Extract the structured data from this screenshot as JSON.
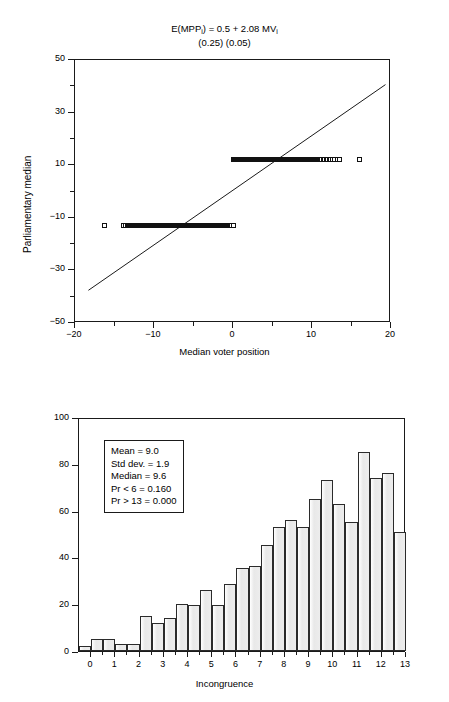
{
  "figure": {
    "panels": [
      "scatter",
      "histogram"
    ]
  },
  "scatter": {
    "title_line1_parts": {
      "lhs": "E(MPP",
      "lhs_sub": "i",
      "rhs": ") = 0.5 + 2.08 MV",
      "rhs_sub": "i"
    },
    "title_line1": "E(MPPi) = 0.5 + 2.08 MVi",
    "title_line2": "(0.25) (0.05)",
    "xlabel": "Median voter position",
    "ylabel": "Parliamentary median",
    "xticks": [
      "-20",
      "-10",
      "0",
      "10",
      "20"
    ],
    "yticks": [
      "50",
      "30",
      "10",
      "-10",
      "-30",
      "-50"
    ],
    "xlim": [
      -20,
      20
    ],
    "ylim": [
      -50,
      50
    ]
  },
  "histogram": {
    "xlabel": "Incongruence",
    "xticks": [
      "0.0",
      "1",
      "2",
      "3",
      "4",
      "5",
      "6",
      "7",
      "8",
      "9",
      "10",
      "11",
      "12",
      "13"
    ],
    "yticks": [
      "100",
      "80",
      "60",
      "40",
      "20",
      "0"
    ],
    "stats": {
      "mean": "Mean = 9.0",
      "std_dev": "Std dev. = 1.9",
      "median": "Median = 9.6",
      "pr_lt_6": "Pr < 6 = 0.160",
      "pr_gt_13": "Pr > 13 = 0.000"
    }
  },
  "chart_data": [
    {
      "type": "scatter",
      "title": "E(MPPi) = 0.5 + 2.08 MVi   (0.25) (0.05)",
      "xlabel": "Median voter position",
      "ylabel": "Parliamentary median",
      "xlim": [
        -20,
        20
      ],
      "ylim": [
        -50,
        50
      ],
      "xticks": [
        -20,
        -10,
        0,
        10,
        20
      ],
      "yticks": [
        50,
        30,
        10,
        -10,
        -30,
        -50
      ],
      "grid": false,
      "legend": null,
      "fit_line": {
        "intercept": 0.5,
        "slope": 2.08,
        "se_intercept": 0.25,
        "se_slope": 0.05,
        "x_from": -18.3,
        "x_to": 19.3
      },
      "series": [
        {
          "name": "upper band (parliamentary median = 12)",
          "y_value": 12,
          "marker": "square",
          "x": [
            0.0,
            0.15,
            0.3,
            0.45,
            0.6,
            0.75,
            0.9,
            1.05,
            1.2,
            1.35,
            1.5,
            1.65,
            1.8,
            1.95,
            2.1,
            2.25,
            2.4,
            2.55,
            2.7,
            2.85,
            3.0,
            3.15,
            3.3,
            3.45,
            3.6,
            3.75,
            3.9,
            4.05,
            4.2,
            4.35,
            4.5,
            4.65,
            4.8,
            4.95,
            5.1,
            5.25,
            5.4,
            5.55,
            5.7,
            5.85,
            6.0,
            6.15,
            6.3,
            6.45,
            6.6,
            6.75,
            6.9,
            7.05,
            7.2,
            7.35,
            7.5,
            7.65,
            7.8,
            7.95,
            8.1,
            8.25,
            8.4,
            8.55,
            8.7,
            8.85,
            9.0,
            9.15,
            9.3,
            9.45,
            9.6,
            9.75,
            9.9,
            10.05,
            10.2,
            10.35,
            10.5,
            10.65,
            10.8,
            11.0,
            11.2,
            11.4,
            11.6,
            11.8,
            12.0,
            12.2,
            12.4,
            12.6,
            12.9,
            13.2,
            13.5,
            16.0
          ]
        },
        {
          "name": "lower band (parliamentary median = -13)",
          "y_value": -13,
          "marker": "square",
          "x": [
            -16.3,
            -13.9,
            -13.6,
            -13.3,
            -13.1,
            -12.9,
            -12.7,
            -12.5,
            -12.3,
            -12.1,
            -11.9,
            -11.7,
            -11.5,
            -11.3,
            -11.1,
            -10.9,
            -10.7,
            -10.5,
            -10.3,
            -10.1,
            -9.9,
            -9.7,
            -9.5,
            -9.3,
            -9.1,
            -8.9,
            -8.7,
            -8.5,
            -8.3,
            -8.1,
            -7.9,
            -7.7,
            -7.5,
            -7.3,
            -7.1,
            -6.9,
            -6.7,
            -6.5,
            -6.3,
            -6.1,
            -5.9,
            -5.7,
            -5.5,
            -5.3,
            -5.1,
            -4.9,
            -4.7,
            -4.5,
            -4.3,
            -4.1,
            -3.9,
            -3.7,
            -3.5,
            -3.3,
            -3.1,
            -2.9,
            -2.7,
            -2.5,
            -2.3,
            -2.1,
            -1.9,
            -1.7,
            -1.5,
            -1.3,
            -1.1,
            -0.9,
            -0.7,
            -0.5,
            -0.3,
            -0.15,
            0.0
          ]
        }
      ]
    },
    {
      "type": "bar",
      "title": "",
      "xlabel": "Incongruence",
      "ylabel": "",
      "xlim": [
        -0.5,
        13
      ],
      "ylim": [
        0,
        100
      ],
      "yticks": [
        0,
        20,
        40,
        60,
        80,
        100
      ],
      "xticks": [
        0.0,
        1,
        2,
        3,
        4,
        5,
        6,
        7,
        8,
        9,
        10,
        11,
        12,
        13
      ],
      "grid": false,
      "bin_width": 0.5,
      "bin_starts": [
        -0.5,
        0.0,
        0.5,
        1.0,
        1.5,
        2.0,
        2.5,
        3.0,
        3.5,
        4.0,
        4.5,
        5.0,
        5.5,
        6.0,
        6.5,
        7.0,
        7.5,
        8.0,
        8.5,
        9.0,
        9.5,
        10.0,
        10.5,
        11.0,
        11.5,
        12.0,
        12.5
      ],
      "categories": [
        "-0.5",
        "0.0",
        "0.5",
        "1.0",
        "1.5",
        "2.0",
        "2.5",
        "3.0",
        "3.5",
        "4.0",
        "4.5",
        "5.0",
        "5.5",
        "6.0",
        "6.5",
        "7.0",
        "7.5",
        "8.0",
        "8.5",
        "9.0",
        "9.5",
        "10.0",
        "10.5",
        "11.0",
        "11.5",
        "12.0",
        "12.5"
      ],
      "values": [
        2,
        5,
        5,
        3,
        3,
        15,
        12,
        14,
        20,
        19.5,
        26,
        19.5,
        28.5,
        35.5,
        36.5,
        45.5,
        53,
        56,
        53,
        65,
        73,
        63,
        55,
        85,
        74,
        76,
        51
      ],
      "annotations": [
        "Mean = 9.0",
        "Std dev. = 1.9",
        "Median = 9.6",
        "Pr < 6 = 0.160",
        "Pr > 13 = 0.000"
      ]
    }
  ]
}
